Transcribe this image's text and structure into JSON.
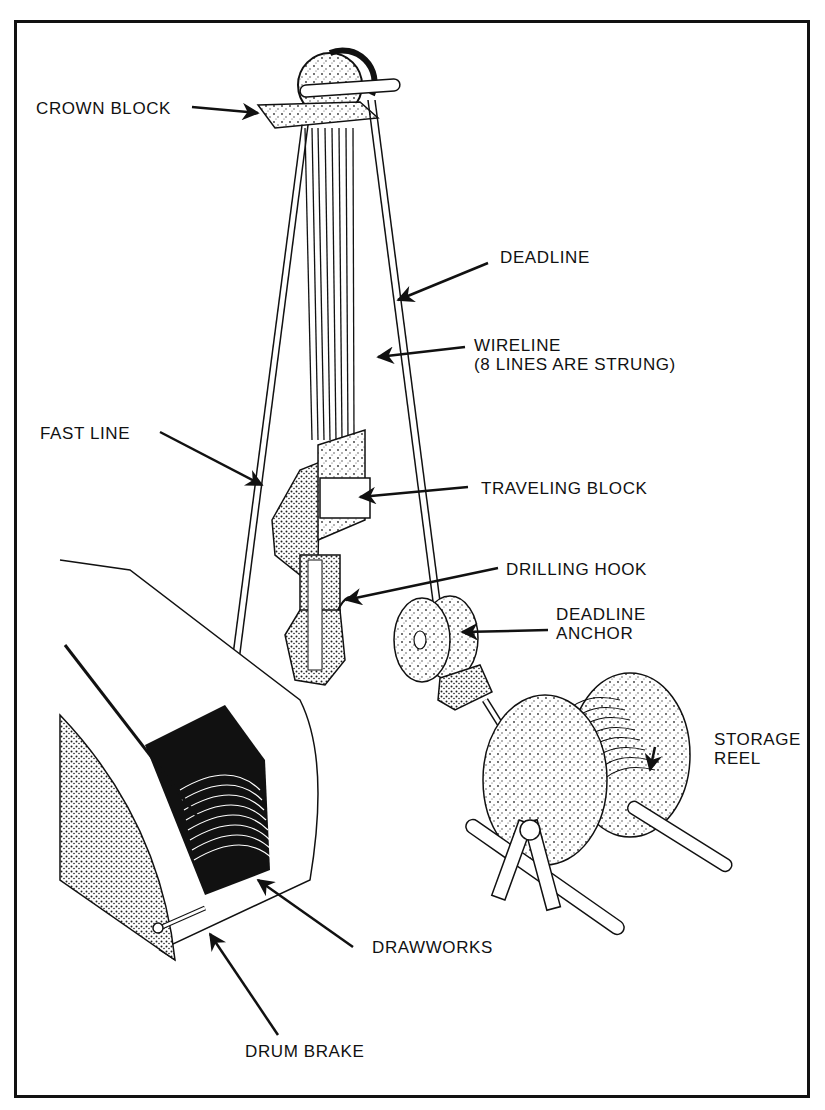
{
  "figure": {
    "labels": {
      "crown_block": "CROWN BLOCK",
      "deadline": "DEADLINE",
      "wireline_line1": "WIRELINE",
      "wireline_line2": "(8 LINES ARE STRUNG)",
      "fast_line": "FAST LINE",
      "traveling_block": "TRAVELING BLOCK",
      "drilling_hook": "DRILLING HOOK",
      "deadline_anchor_line1": "DEADLINE",
      "deadline_anchor_line2": "ANCHOR",
      "storage_reel_line1": "STORAGE",
      "storage_reel_line2": "REEL",
      "drawworks": "DRAWWORKS",
      "drum_brake": "DRUM BRAKE"
    },
    "colors": {
      "ink": "#111111",
      "paper": "#ffffff",
      "stipple": "#555555"
    }
  }
}
